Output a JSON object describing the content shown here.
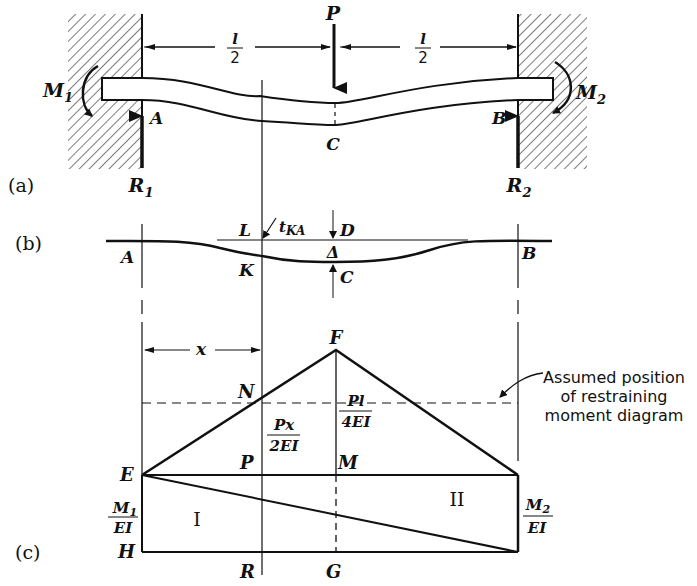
{
  "figure": {
    "parts": {
      "a": "(a)",
      "b": "(b)",
      "c": "(c)"
    },
    "part_a": {
      "load": "P",
      "half_span_left_num": "l",
      "half_span_left_den": "2",
      "half_span_right_num": "l",
      "half_span_right_den": "2",
      "moment_left": "M",
      "moment_left_sub": "1",
      "moment_right": "M",
      "moment_right_sub": "2",
      "support_left": "A",
      "support_right": "B",
      "midpoint": "C",
      "reaction_left": "R",
      "reaction_left_sub": "1",
      "reaction_right": "R",
      "reaction_right_sub": "2"
    },
    "part_b": {
      "point_a": "A",
      "point_b": "B",
      "point_l": "L",
      "point_k": "K",
      "point_d": "D",
      "point_c": "C",
      "deflection": "Δ",
      "tangent_label": "t",
      "tangent_sub": "KA"
    },
    "part_c": {
      "dimension_x": "x",
      "apex": "F",
      "point_n": "N",
      "point_e": "E",
      "point_p": "P",
      "point_m": "M",
      "point_h": "H",
      "point_r": "R",
      "point_g": "G",
      "ordinate_px_num": "Px",
      "ordinate_px_den": "2EI",
      "ordinate_pl_num": "Pl",
      "ordinate_pl_den": "4EI",
      "left_ordinate_num": "M",
      "left_ordinate_num_sub": "1",
      "left_ordinate_den": "EI",
      "right_ordinate_num": "M",
      "right_ordinate_num_sub": "2",
      "right_ordinate_den": "EI",
      "area_1": "I",
      "area_2": "II",
      "note_line1": "Assumed position",
      "note_line2": "of restraining",
      "note_line3": "moment diagram"
    }
  }
}
